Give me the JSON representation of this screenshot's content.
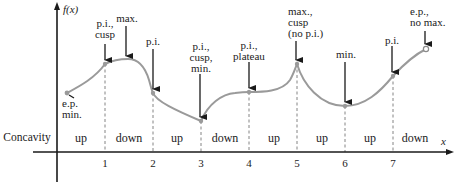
{
  "axes": {
    "y_label": "f(x)",
    "x_label": "x",
    "concavity_label": "Concavity"
  },
  "ticks": [
    "1",
    "2",
    "3",
    "4",
    "5",
    "6",
    "7"
  ],
  "concavity": [
    "up",
    "down",
    "up",
    "down",
    "up",
    "up",
    "up",
    "down"
  ],
  "annotations": {
    "ep_min": "e.p.\nmin.",
    "pi_cusp": "p.i.,\ncusp",
    "max": "max.",
    "pi_2": "p.i.",
    "pi_cusp_min": "p.i.,\ncusp,\nmin.",
    "pi_plateau": "p.i.,\nplateau",
    "max_cusp_no_pi": "max.,\ncusp\n(no p.i.)",
    "min": "min.",
    "pi_7": "p.i.",
    "ep_no_max": "e.p.,\nno max."
  },
  "colors": {
    "curve": "#9a9a9a",
    "axis": "#1a1a1a",
    "dashed": "#777777",
    "text": "#222222"
  }
}
